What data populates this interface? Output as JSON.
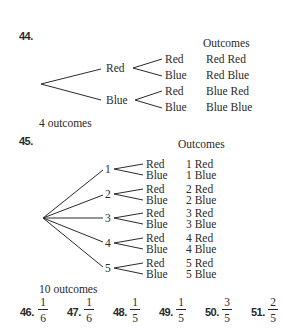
{
  "problem_44": {
    "number": "44.",
    "outcomes_header": "Outcomes",
    "first_level": [
      {
        "label": "Red",
        "branches": [
          {
            "label": "Red",
            "outcome": "Red Red"
          },
          {
            "label": "Blue",
            "outcome": "Red Blue"
          }
        ]
      },
      {
        "label": "Blue",
        "branches": [
          {
            "label": "Red",
            "outcome": "Blue Red"
          },
          {
            "label": "Blue",
            "outcome": "Blue Blue"
          }
        ]
      }
    ],
    "summary": "4 outcomes"
  },
  "problem_45": {
    "number": "45.",
    "outcomes_header": "Outcomes",
    "first_level": [
      {
        "label": "1",
        "branches": [
          {
            "label": "Red",
            "outcome": "1 Red"
          },
          {
            "label": "Blue",
            "outcome": "1 Blue"
          }
        ]
      },
      {
        "label": "2",
        "branches": [
          {
            "label": "Red",
            "outcome": "2 Red"
          },
          {
            "label": "Blue",
            "outcome": "2 Blue"
          }
        ]
      },
      {
        "label": "3",
        "branches": [
          {
            "label": "Red",
            "outcome": "3 Red"
          },
          {
            "label": "Blue",
            "outcome": "3 Blue"
          }
        ]
      },
      {
        "label": "4",
        "branches": [
          {
            "label": "Red",
            "outcome": "4 Red"
          },
          {
            "label": "Blue",
            "outcome": "4 Blue"
          }
        ]
      },
      {
        "label": "5",
        "branches": [
          {
            "label": "Red",
            "outcome": "5 Red"
          },
          {
            "label": "Blue",
            "outcome": "5 Blue"
          }
        ]
      }
    ],
    "summary": "10 outcomes"
  },
  "answers": [
    {
      "number": "46.",
      "numerator": "1",
      "denominator": "6"
    },
    {
      "number": "47.",
      "numerator": "1",
      "denominator": "6"
    },
    {
      "number": "48.",
      "numerator": "1",
      "denominator": "5"
    },
    {
      "number": "49.",
      "numerator": "1",
      "denominator": "5"
    },
    {
      "number": "50.",
      "numerator": "3",
      "denominator": "5"
    },
    {
      "number": "51.",
      "numerator": "2",
      "denominator": "5"
    }
  ]
}
